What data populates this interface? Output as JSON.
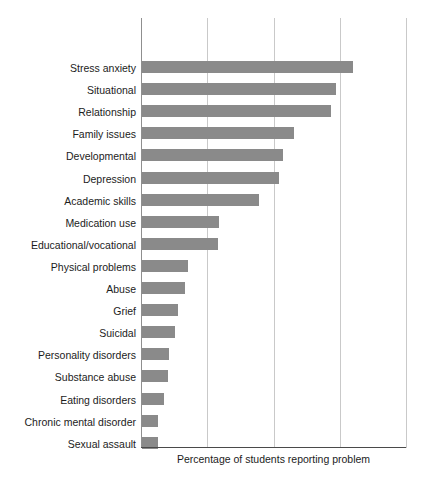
{
  "chart_data": {
    "type": "bar",
    "orientation": "horizontal",
    "title": "",
    "subtitle": "",
    "xlabel": "Percentage of students reporting problem",
    "ylabel": "",
    "grid": true,
    "legend": null,
    "xlim": [
      0,
      60
    ],
    "xticks": [
      0,
      15,
      30,
      45,
      60
    ],
    "xtick_labels": [
      "",
      "",
      "",
      "",
      ""
    ],
    "bar_color": "#8a8a8a",
    "axis_color": "#4a4a4a",
    "gridline_color": "#c9c9c9",
    "categories": [
      "Stress anxiety",
      "Situational",
      "Relationship",
      "Family issues",
      "Developmental",
      "Depression",
      "Academic skills",
      "Medication use",
      "Educational/vocational",
      "Physical problems",
      "Abuse",
      "Grief",
      "Suicidal",
      "Personality disorders",
      "Substance abuse",
      "Eating disorders",
      "Chronic mental disorder",
      "Sexual assault"
    ],
    "values": [
      47.7,
      43.9,
      42.9,
      34.4,
      31.9,
      31.0,
      26.5,
      17.4,
      17.2,
      10.4,
      9.7,
      8.1,
      7.5,
      6.1,
      5.9,
      5.0,
      3.6,
      3.6
    ],
    "value_unit": "%"
  }
}
